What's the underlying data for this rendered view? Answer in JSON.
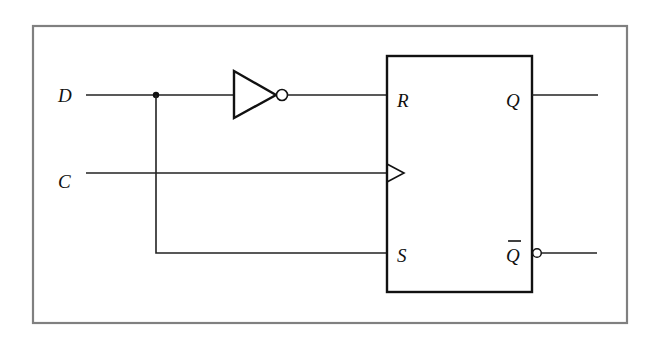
{
  "diagram": {
    "type": "D flip-flop built from SR flip-flop with inverter",
    "inputs": {
      "d": "D",
      "c": "C"
    },
    "flipflop": {
      "r": "R",
      "s": "S",
      "q": "Q",
      "qbar": "Q"
    },
    "colors": {
      "frame": "#808080",
      "wire": "#222222",
      "background": "#ffffff"
    }
  }
}
